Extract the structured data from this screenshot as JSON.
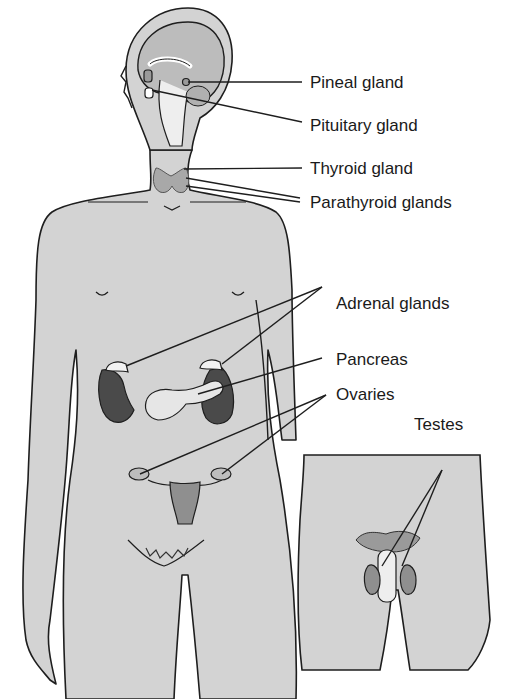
{
  "figure": {
    "colors": {
      "skin": "#d3d3d3",
      "outline": "#1e1e1e",
      "organ_dark": "#4a4a4a",
      "organ_mid": "#9a9a9a",
      "organ_light": "#eeeeee",
      "background": "#ffffff"
    },
    "labels": [
      {
        "id": "pineal",
        "text": "Pineal gland"
      },
      {
        "id": "pituitary",
        "text": "Pituitary gland"
      },
      {
        "id": "thyroid",
        "text": "Thyroid gland"
      },
      {
        "id": "parathyroid",
        "text": "Parathyroid glands"
      },
      {
        "id": "adrenal",
        "text": "Adrenal glands"
      },
      {
        "id": "pancreas",
        "text": "Pancreas"
      },
      {
        "id": "ovaries",
        "text": "Ovaries"
      },
      {
        "id": "testes",
        "text": "Testes"
      }
    ]
  }
}
